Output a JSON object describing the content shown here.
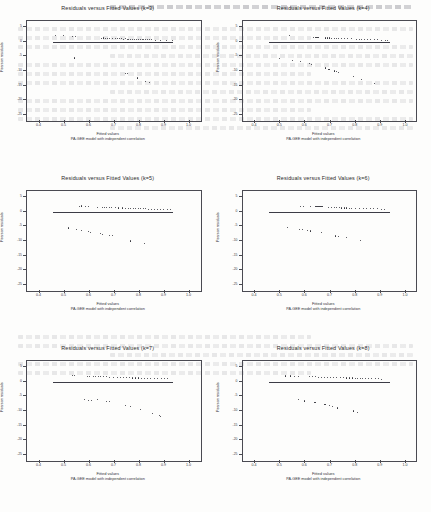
{
  "document": {
    "kind": "scanned-figure-page",
    "background_artifact": "faint bleed-through text from reverse side of scanned page"
  },
  "figure": {
    "xlabel": "Fitted values",
    "ylabel": "Pearson residuals",
    "subtitle": "PA-GEE model with independent correlation",
    "xticks": [
      "0.4",
      "0.5",
      "0.6",
      "0.7",
      "0.8",
      "0.9",
      "1.0"
    ],
    "yticks": [
      "5",
      "0",
      "-5",
      "-10",
      "-15",
      "-20",
      "-25"
    ],
    "xlim": [
      0.35,
      1.05
    ],
    "ylim": [
      -27,
      7
    ],
    "zero_line_y": 0,
    "zero_line_x_start": 0.455,
    "zero_line_x_end": 0.935
  },
  "chart_data": [
    {
      "type": "scatter",
      "title": "Residuals versus Fitted Values (k=3)",
      "xlabel": "Fitted values",
      "ylabel": "Pearson residuals",
      "subtitle": "PA-GEE model with independent correlation",
      "xlim": [
        0.35,
        1.05
      ],
      "ylim": [
        -27,
        7
      ],
      "grid": false,
      "legend": "none",
      "reference_line": {
        "y": 0,
        "x_from": 0.455,
        "x_to": 0.935
      },
      "points": [
        [
          0.462,
          2.3
        ],
        [
          0.492,
          2.2
        ],
        [
          0.53,
          2.0
        ],
        [
          0.543,
          2.0
        ],
        [
          0.645,
          1.3
        ],
        [
          0.652,
          1.4
        ],
        [
          0.661,
          1.3
        ],
        [
          0.669,
          1.2
        ],
        [
          0.678,
          1.3
        ],
        [
          0.69,
          1.2
        ],
        [
          0.7,
          1.1
        ],
        [
          0.709,
          1.2
        ],
        [
          0.717,
          1.1
        ],
        [
          0.724,
          1.1
        ],
        [
          0.732,
          1.0
        ],
        [
          0.74,
          1.1
        ],
        [
          0.748,
          1.0
        ],
        [
          0.755,
          1.0
        ],
        [
          0.763,
          1.0
        ],
        [
          0.77,
          0.9
        ],
        [
          0.778,
          1.0
        ],
        [
          0.786,
          0.9
        ],
        [
          0.793,
          0.9
        ],
        [
          0.8,
          0.9
        ],
        [
          0.808,
          0.9
        ],
        [
          0.815,
          0.8
        ],
        [
          0.823,
          0.9
        ],
        [
          0.83,
          0.8
        ],
        [
          0.838,
          0.8
        ],
        [
          0.845,
          0.8
        ],
        [
          0.862,
          0.7
        ],
        [
          0.88,
          0.7
        ],
        [
          0.905,
          0.6
        ],
        [
          0.928,
          0.6
        ],
        [
          0.537,
          -5.4
        ],
        [
          0.742,
          -10.6
        ],
        [
          0.751,
          -10.8
        ],
        [
          0.79,
          -12.2
        ],
        [
          0.822,
          -13.4
        ],
        [
          0.836,
          -13.6
        ]
      ]
    },
    {
      "type": "scatter",
      "title": "Residuals versus Fitted Values (k=4)",
      "xlabel": "Fitted values",
      "ylabel": "Pearson residuals",
      "subtitle": "PA-GEE model with independent correlation",
      "xlim": [
        0.35,
        1.05
      ],
      "ylim": [
        -27,
        7
      ],
      "grid": false,
      "legend": "none",
      "reference_line": {
        "y": 0,
        "x_from": 0.455,
        "x_to": 0.935
      },
      "points": [
        [
          0.535,
          2.4
        ],
        [
          0.63,
          1.6
        ],
        [
          0.64,
          1.6
        ],
        [
          0.648,
          1.5
        ],
        [
          0.678,
          1.4
        ],
        [
          0.686,
          1.4
        ],
        [
          0.694,
          1.4
        ],
        [
          0.702,
          1.3
        ],
        [
          0.713,
          1.3
        ],
        [
          0.722,
          1.2
        ],
        [
          0.73,
          1.3
        ],
        [
          0.74,
          1.2
        ],
        [
          0.752,
          1.2
        ],
        [
          0.766,
          1.1
        ],
        [
          0.782,
          1.1
        ],
        [
          0.8,
          1.0
        ],
        [
          0.812,
          1.0
        ],
        [
          0.822,
          1.0
        ],
        [
          0.832,
          0.9
        ],
        [
          0.844,
          0.9
        ],
        [
          0.856,
          0.9
        ],
        [
          0.872,
          0.8
        ],
        [
          0.886,
          0.8
        ],
        [
          0.9,
          0.7
        ],
        [
          0.918,
          0.7
        ],
        [
          0.926,
          0.7
        ],
        [
          0.495,
          -5.6
        ],
        [
          0.548,
          -6.2
        ],
        [
          0.578,
          -6.6
        ],
        [
          0.613,
          -7.4
        ],
        [
          0.622,
          -7.6
        ],
        [
          0.678,
          -8.8
        ],
        [
          0.692,
          -9.2
        ],
        [
          0.712,
          -9.8
        ],
        [
          0.722,
          -10.0
        ],
        [
          0.73,
          -10.2
        ],
        [
          0.79,
          -11.8
        ],
        [
          0.822,
          -12.6
        ],
        [
          0.872,
          -14.0
        ]
      ]
    },
    {
      "type": "scatter",
      "title": "Residuals versus Fitted Values (k=5)",
      "xlabel": "Fitted values",
      "ylabel": "Pearson residuals",
      "subtitle": "PA-GEE model with independent correlation",
      "xlim": [
        0.35,
        1.05
      ],
      "ylim": [
        -27,
        7
      ],
      "grid": false,
      "legend": "none",
      "reference_line": {
        "y": 0,
        "x_from": 0.455,
        "x_to": 0.935
      },
      "points": [
        [
          0.556,
          2.0
        ],
        [
          0.566,
          2.1
        ],
        [
          0.583,
          2.0
        ],
        [
          0.594,
          2.0
        ],
        [
          0.63,
          1.7
        ],
        [
          0.648,
          1.7
        ],
        [
          0.658,
          1.6
        ],
        [
          0.666,
          1.6
        ],
        [
          0.676,
          1.6
        ],
        [
          0.686,
          1.5
        ],
        [
          0.7,
          1.5
        ],
        [
          0.714,
          1.4
        ],
        [
          0.728,
          1.4
        ],
        [
          0.74,
          1.3
        ],
        [
          0.752,
          1.3
        ],
        [
          0.762,
          1.3
        ],
        [
          0.772,
          1.2
        ],
        [
          0.782,
          1.2
        ],
        [
          0.792,
          1.2
        ],
        [
          0.802,
          1.1
        ],
        [
          0.812,
          1.1
        ],
        [
          0.822,
          1.1
        ],
        [
          0.832,
          1.0
        ],
        [
          0.844,
          1.0
        ],
        [
          0.856,
          1.0
        ],
        [
          0.868,
          0.9
        ],
        [
          0.88,
          0.9
        ],
        [
          0.894,
          0.8
        ],
        [
          0.908,
          0.8
        ],
        [
          0.92,
          0.8
        ],
        [
          0.512,
          -5.4
        ],
        [
          0.545,
          -5.9
        ],
        [
          0.566,
          -6.1
        ],
        [
          0.594,
          -6.6
        ],
        [
          0.6,
          -6.8
        ],
        [
          0.64,
          -7.4
        ],
        [
          0.65,
          -7.5
        ],
        [
          0.676,
          -7.8
        ],
        [
          0.688,
          -7.9
        ],
        [
          0.76,
          -9.8
        ],
        [
          0.818,
          -10.8
        ]
      ]
    },
    {
      "type": "scatter",
      "title": "Residuals versus Fitted Values (k=6)",
      "xlabel": "Fitted values",
      "ylabel": "Pearson residuals",
      "subtitle": "PA-GEE model with independent correlation",
      "xlim": [
        0.35,
        1.05
      ],
      "ylim": [
        -27,
        7
      ],
      "grid": false,
      "legend": "none",
      "reference_line": {
        "y": 0,
        "x_from": 0.455,
        "x_to": 0.935
      },
      "points": [
        [
          0.58,
          1.9
        ],
        [
          0.59,
          1.9
        ],
        [
          0.62,
          1.8
        ],
        [
          0.64,
          1.9
        ],
        [
          0.648,
          1.8
        ],
        [
          0.656,
          1.8
        ],
        [
          0.664,
          1.8
        ],
        [
          0.69,
          1.6
        ],
        [
          0.702,
          1.6
        ],
        [
          0.712,
          1.5
        ],
        [
          0.722,
          1.5
        ],
        [
          0.732,
          1.5
        ],
        [
          0.742,
          1.4
        ],
        [
          0.752,
          1.4
        ],
        [
          0.762,
          1.4
        ],
        [
          0.772,
          1.3
        ],
        [
          0.782,
          1.3
        ],
        [
          0.796,
          1.3
        ],
        [
          0.812,
          1.2
        ],
        [
          0.828,
          1.2
        ],
        [
          0.842,
          1.2
        ],
        [
          0.856,
          1.1
        ],
        [
          0.87,
          1.1
        ],
        [
          0.884,
          1.1
        ],
        [
          0.9,
          1.0
        ],
        [
          0.912,
          1.0
        ],
        [
          0.528,
          -5.3
        ],
        [
          0.576,
          -5.9
        ],
        [
          0.588,
          -6.0
        ],
        [
          0.608,
          -6.3
        ],
        [
          0.62,
          -6.4
        ],
        [
          0.662,
          -6.9
        ],
        [
          0.718,
          -8.1
        ],
        [
          0.728,
          -8.2
        ],
        [
          0.76,
          -8.5
        ],
        [
          0.818,
          -9.5
        ]
      ]
    },
    {
      "type": "scatter",
      "title": "Residuals versus Fitted Values (k=7)",
      "xlabel": "Fitted values",
      "ylabel": "Pearson residuals",
      "subtitle": "PA-GEE model with independent correlation",
      "xlim": [
        0.35,
        1.05
      ],
      "ylim": [
        -27,
        7
      ],
      "grid": false,
      "legend": "none",
      "reference_line": {
        "y": 0,
        "x_from": 0.455,
        "x_to": 0.935
      },
      "points": [
        [
          0.528,
          2.2
        ],
        [
          0.536,
          2.2
        ],
        [
          0.588,
          2.0
        ],
        [
          0.598,
          2.0
        ],
        [
          0.612,
          1.9
        ],
        [
          0.622,
          1.9
        ],
        [
          0.632,
          1.9
        ],
        [
          0.642,
          1.8
        ],
        [
          0.652,
          1.8
        ],
        [
          0.666,
          1.8
        ],
        [
          0.678,
          1.7
        ],
        [
          0.694,
          1.7
        ],
        [
          0.71,
          1.6
        ],
        [
          0.722,
          1.6
        ],
        [
          0.734,
          1.5
        ],
        [
          0.746,
          1.5
        ],
        [
          0.758,
          1.5
        ],
        [
          0.77,
          1.4
        ],
        [
          0.782,
          1.4
        ],
        [
          0.794,
          1.4
        ],
        [
          0.806,
          1.3
        ],
        [
          0.818,
          1.3
        ],
        [
          0.83,
          1.3
        ],
        [
          0.842,
          1.2
        ],
        [
          0.856,
          1.2
        ],
        [
          0.87,
          1.2
        ],
        [
          0.884,
          1.1
        ],
        [
          0.898,
          1.1
        ],
        [
          0.91,
          1.1
        ],
        [
          0.578,
          -5.9
        ],
        [
          0.592,
          -6.1
        ],
        [
          0.606,
          -6.2
        ],
        [
          0.628,
          -6.0
        ],
        [
          0.666,
          -6.6
        ],
        [
          0.678,
          -6.7
        ],
        [
          0.742,
          -7.8
        ],
        [
          0.76,
          -8.4
        ],
        [
          0.8,
          -9.2
        ],
        [
          0.848,
          -10.6
        ],
        [
          0.876,
          -11.4
        ],
        [
          0.88,
          -11.6
        ]
      ]
    },
    {
      "type": "scatter",
      "title": "Residuals versus Fitted Values (k=8)",
      "xlabel": "Fitted values",
      "ylabel": "Pearson residuals",
      "subtitle": "PA-GEE model with independent correlation",
      "xlim": [
        0.35,
        1.05
      ],
      "ylim": [
        -27,
        7
      ],
      "grid": false,
      "legend": "none",
      "reference_line": {
        "y": 0,
        "x_from": 0.455,
        "x_to": 0.935
      },
      "points": [
        [
          0.52,
          2.1
        ],
        [
          0.54,
          2.1
        ],
        [
          0.556,
          2.0
        ],
        [
          0.57,
          2.0
        ],
        [
          0.614,
          1.8
        ],
        [
          0.626,
          1.8
        ],
        [
          0.638,
          1.8
        ],
        [
          0.65,
          1.7
        ],
        [
          0.662,
          1.7
        ],
        [
          0.674,
          1.7
        ],
        [
          0.686,
          1.6
        ],
        [
          0.698,
          1.6
        ],
        [
          0.71,
          1.6
        ],
        [
          0.722,
          1.5
        ],
        [
          0.736,
          1.5
        ],
        [
          0.748,
          1.5
        ],
        [
          0.76,
          1.4
        ],
        [
          0.772,
          1.4
        ],
        [
          0.784,
          1.4
        ],
        [
          0.796,
          1.3
        ],
        [
          0.806,
          1.3
        ],
        [
          0.816,
          1.3
        ],
        [
          0.826,
          1.2
        ],
        [
          0.836,
          1.2
        ],
        [
          0.848,
          1.2
        ],
        [
          0.862,
          1.1
        ],
        [
          0.876,
          1.1
        ],
        [
          0.89,
          1.1
        ],
        [
          0.902,
          1.0
        ],
        [
          0.572,
          -5.8
        ],
        [
          0.596,
          -6.4
        ],
        [
          0.636,
          -7.0
        ],
        [
          0.676,
          -7.6
        ],
        [
          0.694,
          -8.0
        ],
        [
          0.706,
          -8.3
        ],
        [
          0.726,
          -8.8
        ],
        [
          0.79,
          -9.8
        ],
        [
          0.806,
          -10.2
        ]
      ]
    }
  ]
}
